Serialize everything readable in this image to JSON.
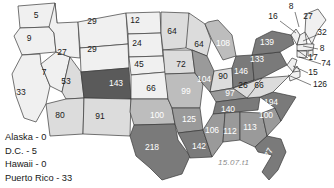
{
  "map": {
    "title": "US choropleth of counts by state",
    "watermark": "15.07.t1",
    "palette": {
      "bin1": "#f0f0f0",
      "bin2": "#dcdcdc",
      "bin3": "#bdbdbd",
      "bin4": "#9a9a9a",
      "bin5": "#7a7a7a",
      "bin6": "#5a5a5a",
      "outline": "#3a3a3a",
      "label_light": "#1a1a1a",
      "label_dark": "#ffffff"
    },
    "states": [
      {
        "code": "WA",
        "value": "5",
        "x": 36,
        "y": 16,
        "fill": "bin1",
        "label": "light"
      },
      {
        "code": "OR",
        "value": "9",
        "x": 29,
        "y": 39,
        "fill": "bin1",
        "label": "light"
      },
      {
        "code": "ID",
        "value": "27",
        "x": 62,
        "y": 53,
        "fill": "bin1",
        "label": "light"
      },
      {
        "code": "NV",
        "value": "7",
        "x": 44,
        "y": 73,
        "fill": "bin1",
        "label": "light"
      },
      {
        "code": "CA",
        "value": "33",
        "x": 21,
        "y": 93,
        "fill": "bin1",
        "label": "light"
      },
      {
        "code": "MT",
        "value": "29",
        "x": 92,
        "y": 22,
        "fill": "bin1",
        "label": "light"
      },
      {
        "code": "WY",
        "value": "29",
        "x": 92,
        "y": 50,
        "fill": "bin1",
        "label": "light"
      },
      {
        "code": "UT",
        "value": "53",
        "x": 66,
        "y": 82,
        "fill": "bin2",
        "label": "light"
      },
      {
        "code": "CO",
        "value": "143",
        "x": 116,
        "y": 84,
        "fill": "bin6",
        "label": "dark"
      },
      {
        "code": "AZ",
        "value": "80",
        "x": 60,
        "y": 116,
        "fill": "bin2",
        "label": "light"
      },
      {
        "code": "NM",
        "value": "91",
        "x": 100,
        "y": 117,
        "fill": "bin2",
        "label": "light"
      },
      {
        "code": "ND",
        "value": "12",
        "x": 135,
        "y": 21,
        "fill": "bin1",
        "label": "light"
      },
      {
        "code": "SD",
        "value": "24",
        "x": 137,
        "y": 44,
        "fill": "bin1",
        "label": "light"
      },
      {
        "code": "NE",
        "value": "45",
        "x": 139,
        "y": 65,
        "fill": "bin1",
        "label": "light"
      },
      {
        "code": "KS",
        "value": "66",
        "x": 151,
        "y": 89,
        "fill": "bin1",
        "label": "light"
      },
      {
        "code": "OK",
        "value": "100",
        "x": 157,
        "y": 116,
        "fill": "bin3",
        "label": "dark"
      },
      {
        "code": "TX",
        "value": "218",
        "x": 152,
        "y": 148,
        "fill": "bin5",
        "label": "dark"
      },
      {
        "code": "MN",
        "value": "64",
        "x": 172,
        "y": 32,
        "fill": "bin2",
        "label": "light"
      },
      {
        "code": "WI",
        "value": "64",
        "x": 199,
        "y": 45,
        "fill": "bin2",
        "label": "light"
      },
      {
        "code": "IA",
        "value": "72",
        "x": 181,
        "y": 65,
        "fill": "bin2",
        "label": "light"
      },
      {
        "code": "MO",
        "value": "99",
        "x": 186,
        "y": 92,
        "fill": "bin3",
        "label": "dark"
      },
      {
        "code": "AR",
        "value": "125",
        "x": 189,
        "y": 120,
        "fill": "bin4",
        "label": "dark"
      },
      {
        "code": "LA",
        "value": "142",
        "x": 199,
        "y": 147,
        "fill": "bin5",
        "label": "dark"
      },
      {
        "code": "MI",
        "value": "108",
        "x": 223,
        "y": 44,
        "fill": "bin3",
        "label": "dark"
      },
      {
        "code": "IL",
        "value": "104",
        "x": 204,
        "y": 80,
        "fill": "bin4",
        "label": "dark"
      },
      {
        "code": "IN",
        "value": "90",
        "x": 223,
        "y": 77,
        "fill": "bin2",
        "label": "light"
      },
      {
        "code": "OH",
        "value": "146",
        "x": 241,
        "y": 72,
        "fill": "bin5",
        "label": "dark"
      },
      {
        "code": "KY",
        "value": "97",
        "x": 230,
        "y": 94,
        "fill": "bin4",
        "label": "dark"
      },
      {
        "code": "TN",
        "value": "140",
        "x": 228,
        "y": 110,
        "fill": "bin5",
        "label": "dark"
      },
      {
        "code": "MS",
        "value": "106",
        "x": 212,
        "y": 131,
        "fill": "bin4",
        "label": "dark"
      },
      {
        "code": "AL",
        "value": "112",
        "x": 230,
        "y": 132,
        "fill": "bin4",
        "label": "dark"
      },
      {
        "code": "GA",
        "value": "113",
        "x": 250,
        "y": 128,
        "fill": "bin4",
        "label": "dark"
      },
      {
        "code": "FL",
        "value": "477",
        "x": 268,
        "y": 155,
        "fill": "bin5",
        "label": "dark",
        "rotate": -62
      },
      {
        "code": "SC",
        "value": "100",
        "x": 266,
        "y": 116,
        "fill": "bin4",
        "label": "dark"
      },
      {
        "code": "NC",
        "value": "194",
        "x": 271,
        "y": 103,
        "fill": "bin5",
        "label": "dark"
      },
      {
        "code": "VA",
        "value": "66",
        "x": 259,
        "y": 86,
        "fill": "bin2",
        "label": "light"
      },
      {
        "code": "WV",
        "value": "26",
        "x": 243,
        "y": 86,
        "fill": "bin2",
        "label": "light"
      },
      {
        "code": "PA",
        "value": "133",
        "x": 257,
        "y": 60,
        "fill": "bin5",
        "label": "dark"
      },
      {
        "code": "NY",
        "value": "139",
        "x": 267,
        "y": 43,
        "fill": "bin5",
        "label": "dark"
      }
    ],
    "callouts": [
      {
        "code": "VT",
        "value": "8",
        "tx": 291,
        "ty": 7,
        "lx": 295,
        "ly": 12,
        "px": 299,
        "py": 27,
        "anchor": "middle"
      },
      {
        "code": "NH",
        "value": "16",
        "tx": 273,
        "ty": 17,
        "lx": 280,
        "ly": 21,
        "px": 296,
        "py": 33,
        "anchor": "middle"
      },
      {
        "code": "ME",
        "value": "27",
        "tx": 308,
        "ty": 17,
        "lx": 308,
        "ly": 17,
        "px": 308,
        "py": 17,
        "anchor": "middle"
      },
      {
        "code": "MA",
        "value": "32",
        "tx": 322,
        "ty": 33,
        "lx": 319,
        "ly": 34,
        "px": 303,
        "py": 41,
        "anchor": "middle"
      },
      {
        "code": "RI",
        "value": "8",
        "tx": 322,
        "ty": 49,
        "lx": 318,
        "ly": 49,
        "px": 303,
        "py": 46,
        "anchor": "middle"
      },
      {
        "code": "CT",
        "value": "17",
        "tx": 313,
        "ty": 58,
        "lx": 308,
        "ly": 58,
        "px": 297,
        "py": 50,
        "anchor": "middle"
      },
      {
        "code": "NJ",
        "value": "74",
        "tx": 326,
        "ty": 64,
        "lx": 321,
        "ly": 64,
        "px": 299,
        "py": 57,
        "anchor": "middle"
      },
      {
        "code": "DE",
        "value": "15",
        "tx": 313,
        "ty": 73,
        "lx": 308,
        "ly": 73,
        "px": 293,
        "py": 66,
        "anchor": "middle"
      },
      {
        "code": "MD",
        "value": "126",
        "tx": 320,
        "ty": 85,
        "lx": 311,
        "ly": 85,
        "px": 288,
        "py": 75,
        "anchor": "middle"
      }
    ],
    "legend": [
      {
        "label": "Alaska - 0"
      },
      {
        "label": "D.C. - 5"
      },
      {
        "label": "Hawaii - 0"
      },
      {
        "label": "Puerto Rico - 33"
      }
    ]
  }
}
